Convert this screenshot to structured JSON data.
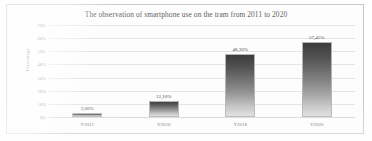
{
  "chart_data": {
    "type": "bar",
    "title": "The observation of smartphone use on the tram from 2011 to 2020",
    "xlabel": "",
    "ylabel": "Percentage",
    "categories": [
      "Y2011",
      "Y2016",
      "Y2018",
      "Y2020"
    ],
    "values": [
      3.0,
      12.1,
      48.3,
      57.45
    ],
    "value_labels": [
      "3,00%",
      "12,10%",
      "48,30%",
      "57,45%"
    ],
    "ylim": [
      0,
      70
    ],
    "ytick_labels": [
      "0%",
      "10%",
      "20%",
      "30%",
      "40%",
      "50%",
      "60%",
      "70%"
    ],
    "ytick_values": [
      0,
      10,
      20,
      30,
      40,
      50,
      60,
      70
    ],
    "grid": true,
    "legend": "none",
    "bar_color_top": "#3b3b3b",
    "bar_color_bottom": "#dcdcdc",
    "gridline_color": "#e4e4e4",
    "border_color": "#c9c9c9"
  }
}
